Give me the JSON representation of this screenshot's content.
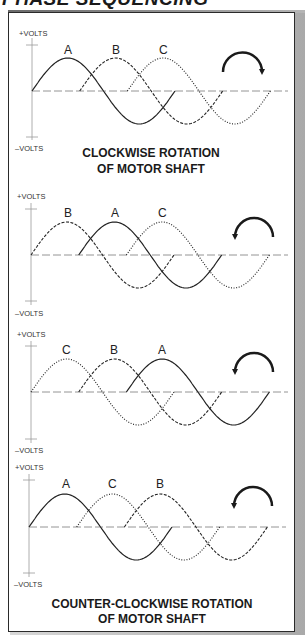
{
  "title": "PHASE SEQUENCING",
  "axis_labels": {
    "positive": "+VOLTS",
    "negative": "–VOLTS"
  },
  "colors": {
    "wave": "#222222",
    "baseline": "#888888",
    "axis": "#999999",
    "frame": "#2a2a2a"
  },
  "panels": [
    {
      "name": "panel-1",
      "order": [
        "A",
        "B",
        "C"
      ],
      "waves": [
        {
          "label": "A",
          "style": "solid",
          "phase_offset": 0
        },
        {
          "label": "B",
          "style": "dashed",
          "phase_offset": 1
        },
        {
          "label": "C",
          "style": "dotted",
          "phase_offset": 2
        }
      ],
      "rotation": "clockwise",
      "caption": [
        "CLOCKWISE ROTATION",
        "OF MOTOR SHAFT"
      ]
    },
    {
      "name": "panel-2",
      "order": [
        "B",
        "A",
        "C"
      ],
      "waves": [
        {
          "label": "B",
          "style": "dashed",
          "phase_offset": 0
        },
        {
          "label": "A",
          "style": "solid",
          "phase_offset": 1
        },
        {
          "label": "C",
          "style": "dotted",
          "phase_offset": 2
        }
      ],
      "rotation": "counter-clockwise",
      "caption": []
    },
    {
      "name": "panel-3",
      "order": [
        "C",
        "B",
        "A"
      ],
      "waves": [
        {
          "label": "C",
          "style": "dotted",
          "phase_offset": 0
        },
        {
          "label": "B",
          "style": "dashed",
          "phase_offset": 1
        },
        {
          "label": "A",
          "style": "solid",
          "phase_offset": 2
        }
      ],
      "rotation": "counter-clockwise",
      "caption": []
    },
    {
      "name": "panel-4",
      "order": [
        "A",
        "C",
        "B"
      ],
      "waves": [
        {
          "label": "A",
          "style": "solid",
          "phase_offset": 0
        },
        {
          "label": "C",
          "style": "dotted",
          "phase_offset": 1
        },
        {
          "label": "B",
          "style": "dashed",
          "phase_offset": 2
        }
      ],
      "rotation": "counter-clockwise",
      "caption": [
        "COUNTER-CLOCKWISE ROTATION",
        "OF MOTOR SHAFT"
      ]
    }
  ]
}
